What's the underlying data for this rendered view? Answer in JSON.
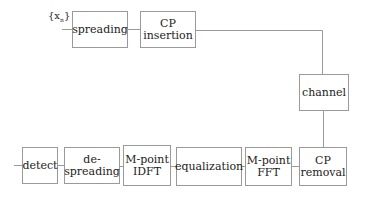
{
  "diagram": {
    "type": "block-diagram",
    "title": "",
    "input_label": {
      "symbol": "{x",
      "subscript": "n",
      "close": "}"
    },
    "transmitter": [
      {
        "id": "spreading",
        "lines": [
          "spreading"
        ]
      },
      {
        "id": "cp-insertion",
        "lines": [
          "CP",
          "insertion"
        ]
      }
    ],
    "channel": {
      "id": "channel",
      "lines": [
        "channel"
      ]
    },
    "receiver": [
      {
        "id": "cp-removal",
        "lines": [
          "CP",
          "removal"
        ]
      },
      {
        "id": "m-point-fft",
        "lines": [
          "M-point",
          "FFT"
        ]
      },
      {
        "id": "equalization",
        "lines": [
          "equalization"
        ]
      },
      {
        "id": "m-point-idft",
        "lines": [
          "M-point",
          "IDFT"
        ]
      },
      {
        "id": "de-spreading",
        "lines": [
          "de-",
          "spreading"
        ]
      },
      {
        "id": "detect",
        "lines": [
          "detect"
        ]
      }
    ],
    "colors": {
      "line": "#9a9a9a",
      "text": "#222222",
      "background": "#ffffff"
    }
  }
}
